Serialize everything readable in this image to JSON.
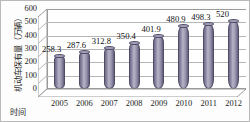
{
  "chart_data": {
    "type": "bar",
    "title": "",
    "subtitle": "",
    "xlabel": "时间",
    "ylabel": "机动车保有量（万辆）",
    "categories": [
      "2005",
      "2006",
      "2007",
      "2008",
      "2009",
      "2010",
      "2011",
      "2012"
    ],
    "values": [
      258.3,
      287.6,
      312.8,
      350.4,
      401.9,
      480.9,
      498.3,
      520
    ],
    "data_labels": [
      "258.3",
      "287.6",
      "312.8",
      "350.4",
      "401.9",
      "480.9",
      "498.3",
      "520"
    ],
    "ylim": [
      0,
      600
    ],
    "yticks": [
      0,
      100,
      200,
      300,
      400,
      500,
      600
    ],
    "ytick_labels": [
      "0",
      "100",
      "200",
      "300",
      "400",
      "500",
      "600"
    ],
    "grid": true,
    "legend": null,
    "legend_position": "none",
    "style": "3d-cylinder",
    "bar_color": "#8b87a0",
    "grid_color": "#b5b5b5",
    "axis_color": "#9a9a9a",
    "background": "#ffffff"
  }
}
